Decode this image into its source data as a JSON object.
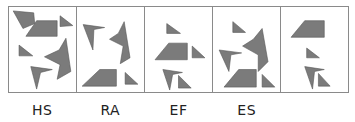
{
  "figure": {
    "type": "shape-sequence-puzzle",
    "shape_fill": "#7b7b7b",
    "border_color": "#8a8a8a",
    "panels": [
      {
        "label": "HS",
        "shapes": [
          "quadrilateral-top-left",
          "trapezoid-center",
          "triangle-top-right",
          "triangle-mid-left",
          "concave-arrow-right",
          "chevron-bottom"
        ]
      },
      {
        "label": "RA",
        "shapes": [
          "chevron-top-left",
          "concave-arrow-right",
          "trapezoid-bottom",
          "triangle-bottom-right"
        ]
      },
      {
        "label": "EF",
        "shapes": [
          "triangle-top",
          "trapezoid-center",
          "triangle-mid-right",
          "chevron-bottom-left",
          "triangle-bottom"
        ]
      },
      {
        "label": "ES",
        "shapes": [
          "triangle-top",
          "concave-arrow-center",
          "chevron-left",
          "trapezoid-bottom",
          "triangle-bottom-right"
        ]
      },
      {
        "label": "",
        "shapes": [
          "trapezoid-top",
          "triangle-middle",
          "chevron-bottom",
          "triangle-bottom-right"
        ]
      }
    ]
  }
}
